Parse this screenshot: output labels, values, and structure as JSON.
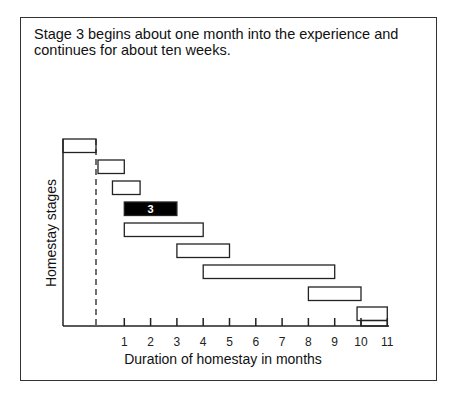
{
  "caption": "Stage 3 begins about one month into the experience and continues for about ten weeks.",
  "chart_data": {
    "type": "bar",
    "subtype": "gantt",
    "title": "Stage 3 begins about one month into the experience and continues for about ten weeks.",
    "xlabel": "Duration of homestay in months",
    "ylabel": "Homestay stages",
    "xticks": [
      "1",
      "2",
      "3",
      "4",
      "5",
      "6",
      "7",
      "8",
      "9",
      "10",
      "11"
    ],
    "xlim": [
      -1.3,
      11
    ],
    "arrival_marker": {
      "x": 0,
      "style": "dashed"
    },
    "highlighted_stage": 3,
    "stages": [
      {
        "stage": 0,
        "start": -1.3,
        "end": -0.05,
        "label": "",
        "highlight": false
      },
      {
        "stage": 1,
        "start": 0,
        "end": 1.0,
        "label": "",
        "highlight": false
      },
      {
        "stage": 2,
        "start": 0.55,
        "end": 1.6,
        "label": "",
        "highlight": false
      },
      {
        "stage": 3,
        "start": 1.0,
        "end": 3.0,
        "label": "3",
        "highlight": true
      },
      {
        "stage": 4,
        "start": 1.0,
        "end": 4.0,
        "label": "",
        "highlight": false
      },
      {
        "stage": 5,
        "start": 3.0,
        "end": 5.0,
        "label": "",
        "highlight": false
      },
      {
        "stage": 6,
        "start": 4.0,
        "end": 9.0,
        "label": "",
        "highlight": false
      },
      {
        "stage": 7,
        "start": 8.0,
        "end": 10.0,
        "label": "",
        "highlight": false
      },
      {
        "stage": 8,
        "start": 9.85,
        "end": 11.0,
        "label": "",
        "highlight": false
      }
    ],
    "grid": false,
    "legend": null
  }
}
